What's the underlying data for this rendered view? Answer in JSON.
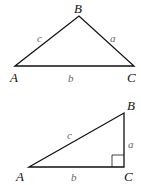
{
  "diagram": {
    "triangles": [
      {
        "name": "oblique-triangle",
        "vertices": {
          "A": "A",
          "B": "B",
          "C": "C"
        },
        "sides": {
          "a": "a",
          "b": "b",
          "c": "c"
        }
      },
      {
        "name": "right-triangle",
        "vertices": {
          "A": "A",
          "B": "B",
          "C": "C"
        },
        "sides": {
          "a": "a",
          "b": "b",
          "c": "c"
        },
        "right_angle_at": "C"
      }
    ]
  }
}
